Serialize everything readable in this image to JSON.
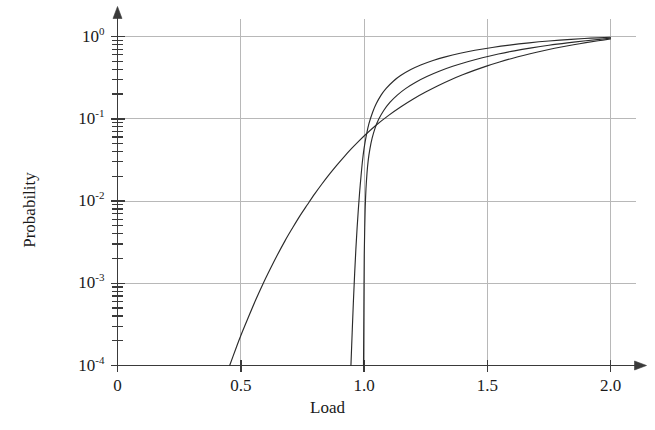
{
  "chart_data": {
    "type": "line",
    "title": "",
    "xlabel": "Load",
    "ylabel": "Probability",
    "xscale": "linear",
    "yscale": "log",
    "xlim": [
      0,
      2.0
    ],
    "ylim": [
      0.0001,
      1.0
    ],
    "grid": true,
    "legend_position": "none",
    "xticks": [
      0,
      0.5,
      1.0,
      1.5,
      2.0
    ],
    "xtick_labels": [
      "0",
      "0.5",
      "1.0",
      "1.5",
      "2.0"
    ],
    "yticks": [
      0.0001,
      0.001,
      0.01,
      0.1,
      1
    ],
    "ytick_labels": [
      "10⁻⁴",
      "10⁻³",
      "10⁻²",
      "10⁻¹",
      "10⁰"
    ],
    "ytick_mantissa": "10",
    "ytick_exponents": [
      "-4",
      "-3",
      "-2",
      "-1",
      "0"
    ],
    "y_minor_ticks": true,
    "axis_arrows": {
      "x_right": true,
      "y_top": true
    },
    "line_color": "#2b2b2b",
    "grid_color": "#b8b8b8",
    "axis_color": "#3a3a3a",
    "background_color": "#ffffff",
    "series": [
      {
        "name": "curve-1-shallow",
        "style": "solid",
        "points": [
          [
            0.455,
            0.0001
          ],
          [
            0.48,
            0.00016
          ],
          [
            0.5,
            0.00023
          ],
          [
            0.53,
            0.00038
          ],
          [
            0.56,
            0.00062
          ],
          [
            0.59,
            0.00098
          ],
          [
            0.62,
            0.0015
          ],
          [
            0.65,
            0.00225
          ],
          [
            0.68,
            0.0033
          ],
          [
            0.71,
            0.0047
          ],
          [
            0.74,
            0.0066
          ],
          [
            0.77,
            0.009
          ],
          [
            0.8,
            0.0122
          ],
          [
            0.83,
            0.0162
          ],
          [
            0.86,
            0.0212
          ],
          [
            0.89,
            0.0273
          ],
          [
            0.92,
            0.0347
          ],
          [
            0.95,
            0.0435
          ],
          [
            0.98,
            0.0538
          ],
          [
            1.01,
            0.0657
          ],
          [
            1.05,
            0.084
          ],
          [
            1.1,
            0.11
          ],
          [
            1.15,
            0.14
          ],
          [
            1.2,
            0.174
          ],
          [
            1.25,
            0.211
          ],
          [
            1.3,
            0.252
          ],
          [
            1.35,
            0.296
          ],
          [
            1.4,
            0.342
          ],
          [
            1.45,
            0.39
          ],
          [
            1.5,
            0.44
          ],
          [
            1.55,
            0.49
          ],
          [
            1.6,
            0.541
          ],
          [
            1.65,
            0.592
          ],
          [
            1.7,
            0.643
          ],
          [
            1.75,
            0.694
          ],
          [
            1.8,
            0.744
          ],
          [
            1.85,
            0.793
          ],
          [
            1.9,
            0.841
          ],
          [
            1.95,
            0.887
          ],
          [
            2.0,
            0.932
          ]
        ]
      },
      {
        "name": "curve-2-steep-a",
        "style": "solid",
        "points": [
          [
            0.947,
            0.0001
          ],
          [
            0.952,
            0.00025
          ],
          [
            0.957,
            0.0006
          ],
          [
            0.962,
            0.0013
          ],
          [
            0.967,
            0.0026
          ],
          [
            0.972,
            0.0047
          ],
          [
            0.977,
            0.0079
          ],
          [
            0.982,
            0.0125
          ],
          [
            0.987,
            0.0187
          ],
          [
            0.993,
            0.029
          ],
          [
            1.0,
            0.043
          ],
          [
            1.01,
            0.064
          ],
          [
            1.02,
            0.087
          ],
          [
            1.035,
            0.12
          ],
          [
            1.05,
            0.153
          ],
          [
            1.07,
            0.195
          ],
          [
            1.09,
            0.234
          ],
          [
            1.12,
            0.288
          ],
          [
            1.15,
            0.337
          ],
          [
            1.19,
            0.396
          ],
          [
            1.23,
            0.45
          ],
          [
            1.28,
            0.511
          ],
          [
            1.33,
            0.566
          ],
          [
            1.39,
            0.626
          ],
          [
            1.45,
            0.68
          ],
          [
            1.52,
            0.736
          ],
          [
            1.59,
            0.787
          ],
          [
            1.67,
            0.838
          ],
          [
            1.75,
            0.882
          ],
          [
            1.84,
            0.923
          ],
          [
            1.92,
            0.954
          ],
          [
            2.0,
            0.98
          ]
        ]
      },
      {
        "name": "curve-3-steep-b",
        "style": "solid",
        "points": [
          [
            0.998,
            0.0001
          ],
          [
            0.999,
            0.0003
          ],
          [
            1.0,
            0.0009
          ],
          [
            1.001,
            0.0022
          ],
          [
            1.003,
            0.0048
          ],
          [
            1.005,
            0.0085
          ],
          [
            1.008,
            0.014
          ],
          [
            1.012,
            0.0215
          ],
          [
            1.017,
            0.031
          ],
          [
            1.024,
            0.043
          ],
          [
            1.033,
            0.058
          ],
          [
            1.045,
            0.077
          ],
          [
            1.06,
            0.099
          ],
          [
            1.08,
            0.126
          ],
          [
            1.105,
            0.158
          ],
          [
            1.135,
            0.194
          ],
          [
            1.17,
            0.234
          ],
          [
            1.21,
            0.278
          ],
          [
            1.255,
            0.326
          ],
          [
            1.305,
            0.378
          ],
          [
            1.36,
            0.434
          ],
          [
            1.42,
            0.494
          ],
          [
            1.48,
            0.552
          ],
          [
            1.545,
            0.612
          ],
          [
            1.61,
            0.67
          ],
          [
            1.68,
            0.728
          ],
          [
            1.75,
            0.783
          ],
          [
            1.825,
            0.837
          ],
          [
            1.9,
            0.888
          ],
          [
            1.955,
            0.924
          ],
          [
            2.0,
            0.954
          ]
        ]
      }
    ]
  },
  "axes": {
    "x_title": "Load",
    "y_title": "Probability"
  }
}
